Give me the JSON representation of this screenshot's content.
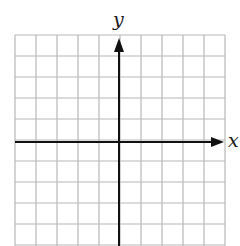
{
  "diagram": {
    "type": "coordinate-grid",
    "x_axis_label": "x",
    "y_axis_label": "y",
    "grid": {
      "columns": 10,
      "rows_visible": 10,
      "cell_size_px": 21,
      "left_px": 15,
      "top_px": 35,
      "right_px": 225,
      "origin_px": [
        119,
        142
      ]
    },
    "colors": {
      "grid_line": "#b8b8b8",
      "axis_line": "#111111",
      "background": "#ffffff"
    }
  }
}
